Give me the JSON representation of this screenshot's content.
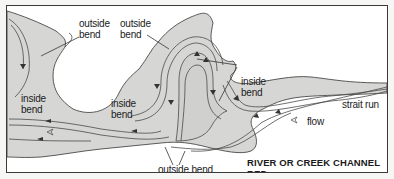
{
  "diagram": {
    "title": "RIVER OR CREEK CHANNEL BED",
    "labels": {
      "outside_bend_1": [
        "outside",
        "bend"
      ],
      "outside_bend_2": [
        "outside",
        "bend"
      ],
      "inside_bend_left": [
        "inside",
        "bend"
      ],
      "inside_bend_middle": [
        "inside",
        "bend"
      ],
      "inside_bend_right": [
        "inside",
        "bend"
      ],
      "outside_bend_bottom": "outside bend",
      "strait_run": "strait run",
      "flow": "flow"
    },
    "colors": {
      "channel_fill": "#d6d6d4",
      "outline": "#4a4a4a",
      "background": "#ffffff",
      "border": "#3a3a3a"
    }
  }
}
